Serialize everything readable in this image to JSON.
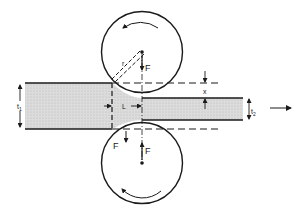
{
  "diagram": {
    "type": "rolling-process-schematic",
    "colors": {
      "line": "#1a1a1a",
      "strip_fill": "#d4d4d4",
      "background": "#ffffff"
    },
    "labels": {
      "top_roll_force": "F",
      "bottom_roll_force": "F",
      "strip_force": "F",
      "radius": "r",
      "contact_length": "L",
      "reduction": "x",
      "entry_thickness": "t",
      "entry_thickness_sub": "1",
      "exit_thickness": "t",
      "exit_thickness_sub": "2"
    },
    "elements": {
      "top_roll": {
        "shape": "circle",
        "rotation": "counter-clockwise"
      },
      "bottom_roll": {
        "shape": "circle",
        "rotation": "clockwise"
      },
      "strip": {
        "shape": "stepped-bar",
        "direction": "right"
      },
      "exit_arrow": {
        "icon": "arrow-right-icon"
      }
    }
  }
}
